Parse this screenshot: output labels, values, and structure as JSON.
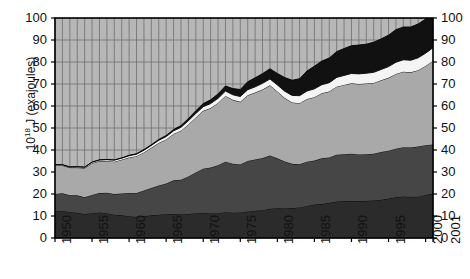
{
  "chart_data": {
    "type": "area",
    "title": "",
    "subtitle": "",
    "xlabel": "",
    "ylabel": "10^18 J (exajoules)",
    "ylabel_mantissa": "10",
    "ylabel_exponent": "18",
    "ylabel_rest": " J (exajoules)",
    "ylim": [
      0,
      100
    ],
    "xlim": [
      1950,
      2001
    ],
    "grid": true,
    "grid_vertical_step": 1,
    "grid_horizontal_step": 10,
    "legend": "none",
    "y_ticks_left": [
      "100",
      "90",
      "80",
      "70",
      "60",
      "50",
      "40",
      "30",
      "20",
      "10",
      "0"
    ],
    "y_ticks_right": [
      "100",
      "90",
      "80",
      "70",
      "60",
      "50",
      "40",
      "30",
      "20",
      "10",
      "0"
    ],
    "y_tick_values": [
      100,
      90,
      80,
      70,
      60,
      50,
      40,
      30,
      20,
      10,
      0
    ],
    "x_ticks": [
      "1950",
      "1955",
      "1960",
      "1965",
      "1970",
      "1975",
      "1980",
      "1985",
      "1990",
      "1995",
      "2000",
      "2001"
    ],
    "x_tick_values": [
      1950,
      1955,
      1960,
      1965,
      1970,
      1975,
      1980,
      1985,
      1990,
      1995,
      2000,
      2001
    ],
    "x": [
      1950,
      1951,
      1952,
      1953,
      1954,
      1955,
      1956,
      1957,
      1958,
      1959,
      1960,
      1961,
      1962,
      1963,
      1964,
      1965,
      1966,
      1967,
      1968,
      1969,
      1970,
      1971,
      1972,
      1973,
      1974,
      1975,
      1976,
      1977,
      1978,
      1979,
      1980,
      1981,
      1982,
      1983,
      1984,
      1985,
      1986,
      1987,
      1988,
      1989,
      1990,
      1991,
      1992,
      1993,
      1994,
      1995,
      1996,
      1997,
      1998,
      1999,
      2000,
      2001
    ],
    "colors": {
      "series1": "#2b2b2b",
      "series2": "#464646",
      "series3": "#a9a9a9",
      "series4": "#f4f4f4",
      "series5": "#111111",
      "plot_background": "#b7b7b7",
      "grid_line": "#6f6f6f",
      "axis_line": "#000000",
      "page_background": "#ffffff",
      "text": "#111111"
    },
    "series": [
      {
        "name": "series1",
        "color": "#2b2b2b",
        "values": [
          12.0,
          12.3,
          11.8,
          11.5,
          10.9,
          11.3,
          11.6,
          11.3,
          10.6,
          10.3,
          9.9,
          9.6,
          9.9,
          10.3,
          10.6,
          10.8,
          11.0,
          10.7,
          10.9,
          11.3,
          11.5,
          11.3,
          11.3,
          11.7,
          11.5,
          11.6,
          12.1,
          12.4,
          12.6,
          13.3,
          13.5,
          13.4,
          13.6,
          13.9,
          14.6,
          15.2,
          15.4,
          16.0,
          16.6,
          16.8,
          16.9,
          16.8,
          16.9,
          17.0,
          17.4,
          17.9,
          18.5,
          18.9,
          18.7,
          18.8,
          19.6,
          20.2
        ]
      },
      {
        "name": "series2",
        "color": "#464646",
        "values": [
          8.0,
          8.0,
          7.6,
          7.9,
          7.6,
          8.3,
          8.8,
          9.3,
          9.4,
          9.9,
          10.6,
          10.9,
          11.7,
          12.4,
          13.3,
          14.0,
          15.2,
          15.8,
          17.1,
          18.5,
          20.0,
          20.7,
          21.8,
          23.0,
          22.3,
          21.8,
          22.9,
          23.3,
          23.8,
          24.2,
          22.7,
          21.4,
          20.1,
          19.6,
          20.1,
          20.0,
          20.8,
          20.6,
          21.2,
          21.3,
          21.4,
          21.2,
          21.2,
          21.3,
          21.7,
          21.8,
          22.1,
          22.4,
          22.4,
          22.8,
          22.6,
          22.3
        ]
      },
      {
        "name": "series3",
        "color": "#a9a9a9",
        "values": [
          13.0,
          12.7,
          12.6,
          12.6,
          13.3,
          14.4,
          14.6,
          14.4,
          14.7,
          15.4,
          16.1,
          16.7,
          17.3,
          18.3,
          19.3,
          20.0,
          21.1,
          22.3,
          23.6,
          25.0,
          26.3,
          27.1,
          28.3,
          29.9,
          29.0,
          28.5,
          29.9,
          30.4,
          31.1,
          31.9,
          30.4,
          28.8,
          27.9,
          27.8,
          28.5,
          28.8,
          29.6,
          30.0,
          31.0,
          31.5,
          32.0,
          32.0,
          32.1,
          32.2,
          32.6,
          33.1,
          34.0,
          34.3,
          34.2,
          34.7,
          36.0,
          38.0
        ]
      },
      {
        "name": "series4",
        "color": "#f4f4f4",
        "values": [
          0.3,
          0.3,
          0.3,
          0.4,
          0.4,
          0.5,
          0.5,
          0.6,
          0.7,
          0.7,
          0.8,
          0.9,
          1.0,
          1.1,
          1.2,
          1.3,
          1.4,
          1.5,
          1.7,
          1.8,
          1.9,
          2.0,
          2.1,
          2.2,
          2.3,
          2.4,
          2.5,
          2.6,
          2.8,
          2.9,
          3.0,
          3.1,
          3.2,
          3.4,
          3.6,
          3.8,
          3.9,
          4.0,
          4.2,
          4.3,
          4.5,
          4.6,
          4.7,
          4.8,
          4.9,
          5.1,
          5.3,
          5.4,
          5.5,
          5.6,
          5.8,
          6.0
        ]
      },
      {
        "name": "series5",
        "color": "#111111",
        "values": [
          0.0,
          0.0,
          0.0,
          0.0,
          0.0,
          0.0,
          0.0,
          0.1,
          0.1,
          0.1,
          0.2,
          0.2,
          0.3,
          0.3,
          0.4,
          0.5,
          0.6,
          0.8,
          1.0,
          1.2,
          1.4,
          1.7,
          2.0,
          2.3,
          2.8,
          3.2,
          3.6,
          4.1,
          4.4,
          4.6,
          5.2,
          6.2,
          6.9,
          7.7,
          9.1,
          10.3,
          10.7,
          11.2,
          11.7,
          12.2,
          12.6,
          13.1,
          13.2,
          13.7,
          13.9,
          14.3,
          14.8,
          14.9,
          15.1,
          15.4,
          15.5,
          15.7
        ]
      }
    ],
    "totals": [
      33.3,
      33.3,
      32.3,
      32.4,
      32.2,
      34.5,
      35.5,
      35.7,
      35.5,
      36.4,
      37.6,
      38.3,
      40.2,
      42.4,
      44.8,
      46.6,
      49.3,
      51.1,
      54.3,
      57.8,
      61.1,
      62.8,
      65.5,
      69.1,
      67.9,
      67.5,
      71.0,
      72.8,
      74.7,
      76.9,
      74.8,
      72.9,
      71.7,
      72.4,
      75.9,
      78.1,
      80.4,
      81.8,
      84.7,
      86.1,
      87.4,
      87.7,
      88.1,
      89.0,
      90.5,
      92.2,
      94.7,
      95.9,
      95.9,
      97.3,
      99.5,
      102.2
    ]
  },
  "watermark": {
    "text": "",
    "edge_mark": "n"
  }
}
